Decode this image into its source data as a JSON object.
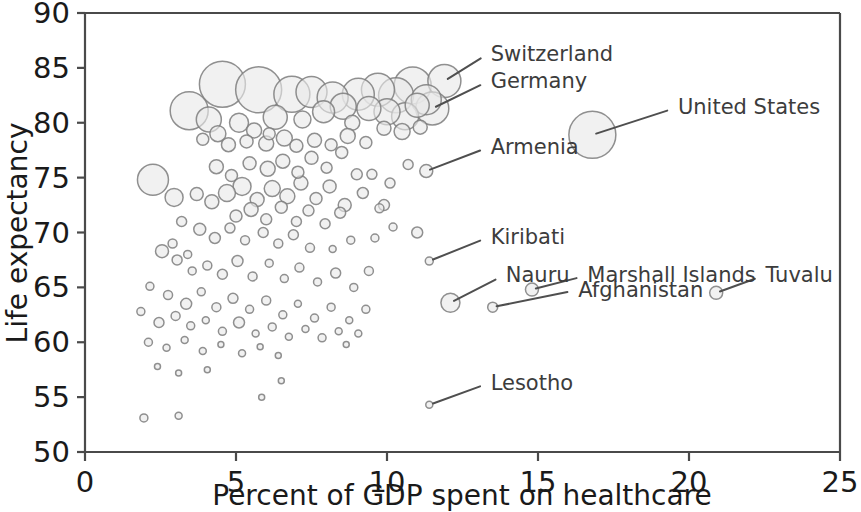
{
  "chart_data": {
    "type": "scatter",
    "title": "",
    "xlabel": "Percent of GDP spent on healthcare",
    "ylabel": "Life expectancy",
    "xlim": [
      0,
      25
    ],
    "ylim": [
      50,
      90
    ],
    "xticks": [
      0,
      5,
      10,
      15,
      20,
      25
    ],
    "yticks": [
      50,
      55,
      60,
      65,
      70,
      75,
      80,
      85,
      90
    ],
    "xtick_labels": [
      "0",
      "5",
      "10",
      "15",
      "20",
      "25"
    ],
    "ytick_labels": [
      "50",
      "55",
      "60",
      "65",
      "70",
      "75",
      "80",
      "85",
      "90"
    ],
    "grid": false,
    "legend": null,
    "marker": "bubble",
    "bubble_size_meaning": "population",
    "bubble_fill": "#e9e9e9",
    "bubble_edge": "#7d7d7d",
    "annotations": [
      {
        "label": "Switzerland",
        "x": 11.9,
        "y": 83.8,
        "text_x": 13.3,
        "text_y": 86.2
      },
      {
        "label": "Germany",
        "x": 11.5,
        "y": 81.3,
        "text_x": 13.3,
        "text_y": 83.7
      },
      {
        "label": "United States",
        "x": 16.8,
        "y": 78.9,
        "text_x": 19.5,
        "text_y": 81.3
      },
      {
        "label": "Armenia",
        "x": 11.3,
        "y": 75.6,
        "text_x": 13.3,
        "text_y": 77.7
      },
      {
        "label": "Kiribati",
        "x": 11.4,
        "y": 67.4,
        "text_x": 13.3,
        "text_y": 69.5
      },
      {
        "label": "Nauru",
        "x": 12.1,
        "y": 63.6,
        "text_x": 13.8,
        "text_y": 66.0
      },
      {
        "label": "Marshall Islands",
        "x": 14.8,
        "y": 64.8,
        "text_x": 16.5,
        "text_y": 66.0
      },
      {
        "label": "Afghanistan",
        "x": 13.5,
        "y": 63.2,
        "text_x": 16.2,
        "text_y": 64.7
      },
      {
        "label": "Tuvalu",
        "x": 20.9,
        "y": 64.5,
        "text_x": 22.4,
        "text_y": 66.0
      },
      {
        "label": "Lesotho",
        "x": 11.4,
        "y": 54.3,
        "text_x": 13.3,
        "text_y": 56.2
      }
    ],
    "points": [
      [
        11.9,
        83.8,
        16.5
      ],
      [
        11.5,
        81.3,
        16.5
      ],
      [
        16.8,
        78.9,
        23.5
      ],
      [
        11.3,
        75.6,
        6.5
      ],
      [
        11.4,
        67.4,
        4.0
      ],
      [
        12.1,
        63.6,
        9.5
      ],
      [
        14.8,
        64.8,
        6.5
      ],
      [
        13.5,
        63.2,
        5.0
      ],
      [
        20.9,
        64.5,
        6.5
      ],
      [
        11.4,
        54.3,
        3.5
      ],
      [
        11.0,
        70.0,
        5.5
      ],
      [
        3.45,
        81.1,
        19.0
      ],
      [
        4.55,
        83.5,
        23.0
      ],
      [
        5.75,
        83.0,
        23.0
      ],
      [
        6.85,
        82.6,
        18.0
      ],
      [
        7.5,
        82.8,
        15.5
      ],
      [
        8.2,
        82.3,
        15.5
      ],
      [
        9.05,
        82.6,
        16.0
      ],
      [
        9.7,
        83.0,
        16.5
      ],
      [
        10.3,
        82.5,
        17.5
      ],
      [
        10.85,
        83.4,
        18.5
      ],
      [
        11.3,
        82.1,
        15.0
      ],
      [
        8.55,
        81.5,
        13.0
      ],
      [
        7.9,
        81.0,
        11.0
      ],
      [
        9.4,
        81.3,
        12.0
      ],
      [
        10.0,
        81.0,
        13.0
      ],
      [
        10.6,
        80.6,
        13.5
      ],
      [
        11.0,
        81.6,
        12.0
      ],
      [
        6.3,
        80.5,
        12.0
      ],
      [
        4.1,
        80.3,
        12.5
      ],
      [
        4.4,
        79.0,
        8.0
      ],
      [
        5.1,
        80.0,
        9.5
      ],
      [
        5.6,
        79.3,
        7.5
      ],
      [
        6.1,
        79.0,
        6.0
      ],
      [
        7.2,
        80.3,
        8.5
      ],
      [
        8.85,
        80.0,
        7.5
      ],
      [
        9.9,
        79.5,
        7.0
      ],
      [
        10.5,
        79.2,
        8.0
      ],
      [
        11.1,
        79.6,
        7.0
      ],
      [
        4.75,
        78.0,
        7.0
      ],
      [
        5.35,
        78.3,
        6.5
      ],
      [
        6.0,
        78.1,
        7.5
      ],
      [
        6.6,
        78.6,
        8.0
      ],
      [
        7.0,
        77.9,
        6.5
      ],
      [
        7.6,
        78.4,
        7.0
      ],
      [
        8.15,
        78.0,
        6.0
      ],
      [
        8.7,
        78.8,
        7.5
      ],
      [
        9.3,
        78.2,
        6.0
      ],
      [
        2.25,
        74.8,
        15.5
      ],
      [
        2.95,
        73.2,
        9.0
      ],
      [
        4.35,
        76.0,
        7.0
      ],
      [
        4.85,
        75.2,
        6.0
      ],
      [
        5.45,
        76.3,
        6.5
      ],
      [
        6.05,
        75.8,
        7.5
      ],
      [
        6.55,
        76.5,
        7.0
      ],
      [
        7.05,
        75.5,
        6.0
      ],
      [
        7.5,
        76.8,
        6.5
      ],
      [
        8.0,
        75.9,
        5.5
      ],
      [
        8.5,
        77.3,
        6.0
      ],
      [
        9.0,
        75.3,
        5.5
      ],
      [
        3.7,
        73.5,
        6.5
      ],
      [
        4.2,
        72.8,
        7.0
      ],
      [
        4.7,
        73.6,
        8.5
      ],
      [
        5.2,
        74.2,
        9.0
      ],
      [
        5.7,
        73.0,
        7.0
      ],
      [
        6.2,
        74.0,
        8.0
      ],
      [
        6.7,
        73.3,
        7.5
      ],
      [
        7.15,
        74.5,
        7.0
      ],
      [
        7.65,
        73.1,
        6.0
      ],
      [
        8.1,
        74.2,
        6.5
      ],
      [
        8.6,
        72.5,
        6.5
      ],
      [
        9.2,
        73.6,
        5.5
      ],
      [
        5.0,
        71.5,
        6.0
      ],
      [
        5.5,
        72.1,
        7.0
      ],
      [
        6.0,
        71.2,
        5.5
      ],
      [
        6.5,
        72.3,
        6.0
      ],
      [
        7.0,
        71.0,
        5.0
      ],
      [
        7.4,
        72.0,
        5.5
      ],
      [
        7.95,
        70.8,
        5.0
      ],
      [
        8.45,
        71.8,
        5.5
      ],
      [
        9.5,
        75.3,
        5.0
      ],
      [
        9.9,
        72.5,
        5.5
      ],
      [
        3.2,
        71.0,
        5.0
      ],
      [
        3.8,
        70.3,
        6.0
      ],
      [
        4.3,
        69.5,
        5.5
      ],
      [
        4.8,
        70.4,
        5.0
      ],
      [
        5.3,
        69.3,
        4.5
      ],
      [
        5.9,
        70.0,
        5.0
      ],
      [
        6.4,
        69.0,
        4.5
      ],
      [
        6.9,
        69.8,
        5.0
      ],
      [
        7.45,
        68.6,
        4.5
      ],
      [
        2.55,
        68.3,
        6.5
      ],
      [
        3.05,
        67.5,
        5.0
      ],
      [
        3.55,
        66.5,
        4.0
      ],
      [
        4.05,
        67.0,
        4.5
      ],
      [
        4.55,
        66.2,
        5.0
      ],
      [
        5.05,
        67.4,
        5.5
      ],
      [
        5.55,
        66.0,
        4.5
      ],
      [
        6.1,
        67.2,
        4.0
      ],
      [
        6.6,
        65.8,
        4.0
      ],
      [
        7.1,
        66.8,
        4.5
      ],
      [
        7.7,
        65.5,
        4.0
      ],
      [
        8.3,
        66.3,
        5.0
      ],
      [
        8.9,
        65.0,
        4.0
      ],
      [
        9.4,
        66.5,
        4.5
      ],
      [
        2.15,
        65.1,
        4.0
      ],
      [
        2.75,
        64.3,
        4.5
      ],
      [
        3.35,
        63.5,
        5.5
      ],
      [
        3.85,
        64.6,
        4.0
      ],
      [
        4.35,
        63.2,
        4.5
      ],
      [
        4.9,
        64.0,
        5.0
      ],
      [
        5.45,
        63.0,
        4.0
      ],
      [
        6.0,
        63.8,
        4.5
      ],
      [
        6.55,
        62.5,
        4.0
      ],
      [
        7.05,
        63.5,
        3.5
      ],
      [
        7.6,
        62.2,
        4.0
      ],
      [
        8.15,
        63.2,
        4.0
      ],
      [
        8.75,
        62.0,
        3.5
      ],
      [
        9.3,
        63.0,
        4.0
      ],
      [
        1.85,
        62.8,
        4.0
      ],
      [
        2.45,
        61.8,
        5.0
      ],
      [
        3.0,
        62.4,
        4.5
      ],
      [
        3.5,
        61.5,
        4.0
      ],
      [
        4.0,
        62.0,
        3.5
      ],
      [
        4.55,
        61.0,
        4.0
      ],
      [
        5.1,
        61.8,
        5.5
      ],
      [
        5.65,
        60.8,
        3.5
      ],
      [
        6.2,
        61.4,
        4.0
      ],
      [
        6.75,
        60.5,
        3.5
      ],
      [
        7.3,
        61.2,
        3.5
      ],
      [
        7.85,
        60.4,
        4.0
      ],
      [
        8.4,
        61.0,
        3.5
      ],
      [
        2.1,
        60.0,
        4.0
      ],
      [
        2.7,
        59.5,
        3.5
      ],
      [
        3.3,
        60.2,
        3.5
      ],
      [
        3.9,
        59.2,
        3.5
      ],
      [
        4.5,
        59.8,
        3.0
      ],
      [
        5.2,
        59.0,
        3.5
      ],
      [
        5.8,
        59.6,
        3.0
      ],
      [
        6.4,
        58.8,
        3.0
      ],
      [
        2.4,
        57.8,
        3.0
      ],
      [
        3.1,
        57.2,
        3.0
      ],
      [
        4.05,
        57.5,
        3.0
      ],
      [
        1.95,
        53.1,
        4.0
      ],
      [
        3.1,
        53.3,
        3.5
      ],
      [
        5.85,
        55.0,
        3.0
      ],
      [
        6.5,
        56.5,
        3.0
      ],
      [
        9.6,
        69.5,
        4.0
      ],
      [
        10.2,
        70.5,
        4.0
      ],
      [
        9.75,
        72.2,
        4.5
      ],
      [
        10.1,
        74.5,
        5.0
      ],
      [
        10.7,
        76.2,
        5.0
      ],
      [
        3.9,
        78.5,
        6.0
      ],
      [
        2.9,
        69.0,
        4.5
      ],
      [
        3.4,
        68.0,
        4.0
      ],
      [
        8.2,
        68.5,
        3.5
      ],
      [
        8.8,
        69.3,
        4.0
      ],
      [
        9.05,
        60.8,
        3.5
      ],
      [
        8.65,
        59.8,
        3.0
      ]
    ]
  }
}
